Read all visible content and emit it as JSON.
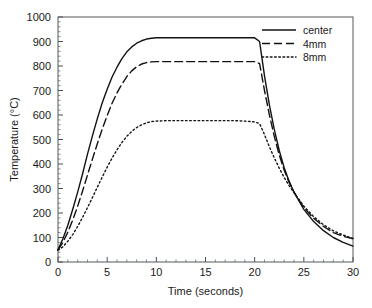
{
  "chart_data": {
    "type": "line",
    "title": "",
    "xlabel": "Time (seconds)",
    "ylabel": "Temperature (°C)",
    "xlim": [
      0,
      30
    ],
    "ylim": [
      0,
      1000
    ],
    "xticks": [
      0,
      5,
      10,
      15,
      20,
      25,
      30
    ],
    "yticks": [
      0,
      100,
      200,
      300,
      400,
      500,
      600,
      700,
      800,
      900,
      1000
    ],
    "xtick_labels": [
      "0",
      "5",
      "10",
      "15",
      "20",
      "25",
      "30"
    ],
    "ytick_labels": [
      "0",
      "100",
      "200",
      "300",
      "400",
      "500",
      "600",
      "700",
      "800",
      "900",
      "1000"
    ],
    "x_minor_tick_interval": 1,
    "y_minor_tick_interval": 20,
    "grid": false,
    "legend_position": "top-right",
    "series": [
      {
        "name": "center",
        "style": "solid",
        "color": "#121212",
        "x": [
          0,
          0.5,
          1,
          1.5,
          2,
          2.5,
          3,
          3.5,
          4,
          4.5,
          5,
          5.5,
          6,
          6.5,
          7,
          7.5,
          8,
          8.5,
          9,
          9.5,
          10,
          11,
          12,
          13,
          14,
          15,
          16,
          17,
          18,
          19,
          20,
          20.5,
          21,
          21.5,
          22,
          22.5,
          23,
          23.5,
          24,
          25,
          26,
          27,
          28,
          29,
          30
        ],
        "y": [
          50,
          95,
          150,
          215,
          285,
          360,
          440,
          515,
          585,
          650,
          705,
          755,
          795,
          830,
          858,
          878,
          893,
          903,
          910,
          913,
          915,
          915,
          915,
          915,
          915,
          915,
          915,
          915,
          915,
          915,
          915,
          900,
          760,
          640,
          540,
          455,
          385,
          330,
          285,
          215,
          165,
          128,
          100,
          80,
          65
        ]
      },
      {
        "name": "4mm",
        "style": "dashed",
        "color": "#121212",
        "x": [
          0,
          0.5,
          1,
          1.5,
          2,
          2.5,
          3,
          3.5,
          4,
          4.5,
          5,
          5.5,
          6,
          6.5,
          7,
          7.5,
          8,
          8.5,
          9,
          9.5,
          10,
          11,
          12,
          13,
          14,
          15,
          16,
          17,
          18,
          19,
          20,
          20.5,
          21,
          21.5,
          22,
          22.5,
          23,
          23.5,
          24,
          25,
          26,
          27,
          28,
          29,
          30
        ],
        "y": [
          50,
          80,
          122,
          172,
          228,
          290,
          355,
          420,
          483,
          543,
          598,
          648,
          690,
          726,
          757,
          780,
          797,
          808,
          814,
          817,
          818,
          818,
          818,
          818,
          818,
          818,
          818,
          818,
          818,
          818,
          818,
          810,
          700,
          600,
          512,
          437,
          375,
          325,
          285,
          222,
          178,
          145,
          120,
          105,
          95
        ]
      },
      {
        "name": "8mm",
        "style": "dotted",
        "color": "#121212",
        "x": [
          0,
          0.5,
          1,
          1.5,
          2,
          2.5,
          3,
          3.5,
          4,
          4.5,
          5,
          5.5,
          6,
          6.5,
          7,
          7.5,
          8,
          8.5,
          9,
          9.5,
          10,
          11,
          12,
          13,
          14,
          15,
          16,
          17,
          18,
          19,
          20,
          20.5,
          21,
          21.5,
          22,
          22.5,
          23,
          23.5,
          24,
          25,
          26,
          27,
          28,
          29,
          30
        ],
        "y": [
          48,
          62,
          85,
          112,
          145,
          182,
          222,
          263,
          305,
          347,
          387,
          424,
          458,
          488,
          513,
          533,
          549,
          560,
          568,
          573,
          575,
          577,
          577,
          577,
          577,
          577,
          577,
          577,
          577,
          575,
          572,
          565,
          520,
          470,
          425,
          383,
          345,
          312,
          283,
          228,
          185,
          152,
          127,
          110,
          96
        ]
      }
    ]
  },
  "legend": {
    "items": [
      {
        "label": "center",
        "style": "solid"
      },
      {
        "label": "4mm",
        "style": "dashed"
      },
      {
        "label": "8mm",
        "style": "dotted"
      }
    ]
  }
}
